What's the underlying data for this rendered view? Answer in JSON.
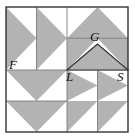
{
  "figure": {
    "colors": {
      "shaded_triangle_fill": "#b3b3b3",
      "background": "#ffffff",
      "outline": "#333333",
      "inner_grid_line": "#7a7a7a",
      "label_color": "#111111"
    },
    "square": {
      "left": 6,
      "top": 7,
      "right": 128,
      "bottom": 132,
      "width": 122,
      "height": 125
    },
    "grid": {
      "midline_x": 67,
      "midline_y": 70,
      "columns": [
        6,
        36.5,
        67,
        97.5,
        128
      ],
      "rows": [
        7,
        38.25,
        70,
        101,
        132
      ]
    },
    "labels": [
      {
        "name": "F",
        "text": "F",
        "x": 9,
        "y": 69
      },
      {
        "name": "G",
        "text": "G",
        "x": 90,
        "y": 41
      },
      {
        "name": "L",
        "text": "L",
        "x": 66,
        "y": 81
      },
      {
        "name": "S",
        "text": "S",
        "x": 117,
        "y": 81
      }
    ],
    "inner_triangle": {
      "name": "triangle-GLS",
      "vertices": [
        {
          "label": "G",
          "x": 97.5,
          "y": 44
        },
        {
          "label": "L",
          "x": 67,
          "y": 70
        },
        {
          "label": "S",
          "x": 128,
          "y": 70
        }
      ],
      "fill": "#b3b3b3"
    },
    "shaded_triangles": [
      {
        "name": "tri-tl-col1",
        "quadrant": "top-left",
        "orientation": "points-left",
        "points": "6,7 36.5,38.25 6,70"
      },
      {
        "name": "tri-tl-col2",
        "quadrant": "top-left",
        "orientation": "points-left",
        "points": "36.5,7 67,38.25 36.5,70"
      },
      {
        "name": "tri-tr-row1",
        "quadrant": "top-right",
        "orientation": "points-up",
        "points": "67,38.25 97.5,7 128,38.25"
      },
      {
        "name": "tri-tr-row2-left",
        "quadrant": "top-right",
        "orientation": "corner-upper-left",
        "points": "67,38.25 97.5,38.25 67,70"
      },
      {
        "name": "tri-tr-row2-right",
        "quadrant": "top-right",
        "orientation": "corner-upper-right",
        "points": "97.5,38.25 128,38.25 128,70"
      },
      {
        "name": "tri-bl-row1",
        "quadrant": "bottom-left",
        "orientation": "points-down",
        "points": "6,70 67,70 36.5,101"
      },
      {
        "name": "tri-bl-row2",
        "quadrant": "bottom-left",
        "orientation": "points-down",
        "points": "6,101 67,101 36.5,132"
      },
      {
        "name": "tri-br-col1",
        "quadrant": "bottom-right",
        "orientation": "points-right",
        "points": "67,70 97.5,85.5 67,101"
      },
      {
        "name": "tri-br-col2",
        "quadrant": "bottom-right",
        "orientation": "points-right",
        "points": "97.5,70 128,85.5 97.5,101"
      },
      {
        "name": "tri-br-bottom-left",
        "quadrant": "bottom-right",
        "orientation": "diagonal-upper-left",
        "points": "67,101 97.5,101 67,132"
      },
      {
        "name": "tri-br-bottom-right",
        "quadrant": "bottom-right",
        "orientation": "diagonal-upper-left",
        "points": "97.5,101 128,101 97.5,132"
      }
    ],
    "grid_lines": [
      {
        "name": "midline-horizontal",
        "x1": 6,
        "y1": 70,
        "x2": 128,
        "y2": 70
      },
      {
        "name": "midline-vertical-top",
        "x1": 67,
        "y1": 7,
        "x2": 67,
        "y2": 70
      },
      {
        "name": "midline-vertical-bottom",
        "x1": 67,
        "y1": 70,
        "x2": 67,
        "y2": 132
      },
      {
        "name": "divider-top-left-vertical",
        "x1": 36.5,
        "y1": 7,
        "x2": 36.5,
        "y2": 70
      },
      {
        "name": "divider-top-right-horizontal",
        "x1": 67,
        "y1": 38.25,
        "x2": 128,
        "y2": 38.25
      },
      {
        "name": "divider-bottom-left-horizontal",
        "x1": 6,
        "y1": 101,
        "x2": 67,
        "y2": 101
      },
      {
        "name": "divider-bottom-right-vertical",
        "x1": 97.5,
        "y1": 70,
        "x2": 97.5,
        "y2": 132
      }
    ]
  }
}
